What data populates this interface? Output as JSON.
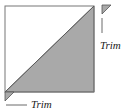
{
  "diagram": {
    "colors": {
      "fill": "#a9a9a9",
      "stroke": "#555555",
      "background": "#ffffff"
    },
    "labels": {
      "top_right_trim": "Trim",
      "bottom_left_trim": "Trim"
    }
  }
}
